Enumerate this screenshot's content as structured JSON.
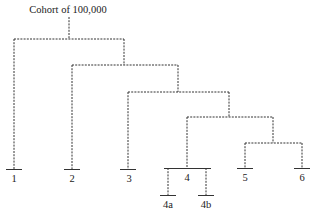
{
  "title": "Cohort of 100,000",
  "leaves": [
    {
      "id": "1",
      "label": "1"
    },
    {
      "id": "2",
      "label": "2"
    },
    {
      "id": "3",
      "label": "3"
    },
    {
      "id": "4",
      "label": "4"
    },
    {
      "id": "4a",
      "label": "4a"
    },
    {
      "id": "4b",
      "label": "4b"
    },
    {
      "id": "5",
      "label": "5"
    },
    {
      "id": "6",
      "label": "6"
    }
  ],
  "structure": "Cohort splits into 1 and rest; rest splits into 2 and rest; then 3 and rest; then (4 -> 4a, 4b) and (5, 6)"
}
